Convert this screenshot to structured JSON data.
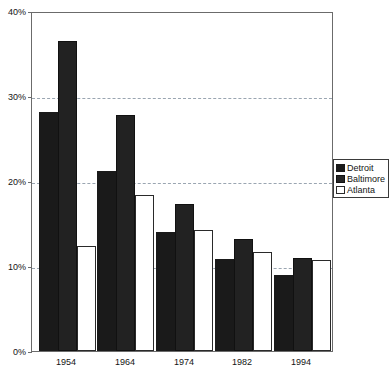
{
  "chart_data": {
    "type": "bar",
    "title": "",
    "subtitle": "",
    "xlabel": "",
    "ylabel": "",
    "categories": [
      "1954",
      "1964",
      "1974",
      "1982",
      "1994"
    ],
    "series": [
      {
        "name": "Detroit",
        "values": [
          28.1,
          21.2,
          14.0,
          10.8,
          9.0
        ],
        "color": "#1a1a1a"
      },
      {
        "name": "Baltimore",
        "values": [
          36.5,
          27.8,
          17.3,
          13.2,
          11.0
        ],
        "color": "#262626"
      },
      {
        "name": "Atlanta",
        "values": [
          12.3,
          18.4,
          14.2,
          11.7,
          10.7
        ],
        "color": "#ffffff"
      }
    ],
    "ylim": [
      0,
      40
    ],
    "yticks": [
      0,
      10,
      20,
      30,
      40
    ],
    "ytick_labels": [
      "0%",
      "10%",
      "20%",
      "30%",
      "40%"
    ],
    "gridlines": [
      10,
      20,
      30
    ],
    "grid": true,
    "legend_position": "right-middle",
    "legend_entries": [
      "Detroit",
      "Baltimore",
      "Atlanta"
    ]
  },
  "axis": {
    "y_labels": [
      "40%",
      "30%",
      "20%",
      "10%",
      "0%"
    ],
    "x_labels": [
      "1954",
      "1964",
      "1974",
      "1982",
      "1994"
    ]
  },
  "legend": {
    "items": [
      {
        "label": "Detroit",
        "swatch": "filled-black-square-icon"
      },
      {
        "label": "Baltimore",
        "swatch": "filled-dark-square-icon"
      },
      {
        "label": "Atlanta",
        "swatch": "outlined-white-square-icon"
      }
    ]
  }
}
